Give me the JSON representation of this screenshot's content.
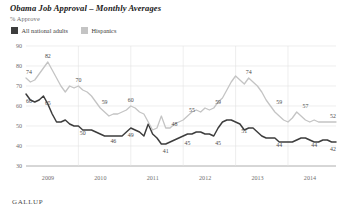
{
  "header": {
    "title": "Obama Job Approval – Monthly Averages",
    "subtitle": "% Approve",
    "source": "GALLUP"
  },
  "legend": {
    "items": [
      {
        "label": "All national adults",
        "color": "#3d3d3d"
      },
      {
        "label": "Hispanics",
        "color": "#c4c4c4"
      }
    ]
  },
  "chart_data": {
    "type": "line",
    "title": "Obama Job Approval – Monthly Averages",
    "subtitle": "% Approve",
    "xlabel": "",
    "ylabel": "% Approve",
    "ylim": [
      30,
      90
    ],
    "yticks": [
      30,
      40,
      50,
      60,
      70,
      80,
      90
    ],
    "xticks": [
      "2009",
      "2010",
      "2011",
      "2012",
      "2013",
      "2014"
    ],
    "xlim": [
      "2009-01",
      "2014-12"
    ],
    "grid": "horizontal-and-vertical",
    "legend_position": "top-left",
    "x": [
      "2009-01",
      "2009-02",
      "2009-03",
      "2009-04",
      "2009-05",
      "2009-06",
      "2009-07",
      "2009-08",
      "2009-09",
      "2009-10",
      "2009-11",
      "2009-12",
      "2010-01",
      "2010-02",
      "2010-03",
      "2010-04",
      "2010-05",
      "2010-06",
      "2010-07",
      "2010-08",
      "2010-09",
      "2010-10",
      "2010-11",
      "2010-12",
      "2011-01",
      "2011-02",
      "2011-03",
      "2011-04",
      "2011-05",
      "2011-06",
      "2011-07",
      "2011-08",
      "2011-09",
      "2011-10",
      "2011-11",
      "2011-12",
      "2012-01",
      "2012-02",
      "2012-03",
      "2012-04",
      "2012-05",
      "2012-06",
      "2012-07",
      "2012-08",
      "2012-09",
      "2012-10",
      "2012-11",
      "2012-12",
      "2013-01",
      "2013-02",
      "2013-03",
      "2013-04",
      "2013-05",
      "2013-06",
      "2013-07",
      "2013-08",
      "2013-09",
      "2013-10",
      "2013-11",
      "2013-12",
      "2014-01",
      "2014-02",
      "2014-03",
      "2014-04",
      "2014-05",
      "2014-06",
      "2014-07",
      "2014-08",
      "2014-09",
      "2014-10",
      "2014-11",
      "2014-12"
    ],
    "series": [
      {
        "name": "All national adults",
        "color": "#3d3d3d",
        "values": [
          66,
          63,
          62,
          63,
          65,
          61,
          56,
          52,
          52,
          53,
          51,
          50,
          50,
          48,
          48,
          48,
          47,
          46,
          45,
          45,
          45,
          45,
          45,
          47,
          49,
          48,
          47,
          45,
          51,
          46,
          44,
          41,
          41,
          42,
          43,
          44,
          45,
          46,
          46,
          47,
          47,
          46,
          46,
          45,
          49,
          52,
          53,
          53,
          52,
          51,
          48,
          49,
          49,
          47,
          45,
          44,
          44,
          44,
          42,
          42,
          42,
          42,
          43,
          44,
          44,
          43,
          42,
          42,
          43,
          43,
          42,
          42
        ]
      },
      {
        "name": "Hispanics",
        "color": "#c4c4c4",
        "values": [
          74,
          72,
          73,
          76,
          79,
          82,
          78,
          74,
          70,
          67,
          70,
          69,
          70,
          68,
          67,
          65,
          62,
          59,
          57,
          55,
          56,
          56,
          57,
          58,
          60,
          59,
          57,
          56,
          52,
          48,
          49,
          55,
          49,
          49,
          51,
          52,
          53,
          55,
          57,
          58,
          57,
          59,
          58,
          59,
          62,
          64,
          68,
          72,
          75,
          73,
          71,
          74,
          72,
          70,
          67,
          63,
          60,
          57,
          55,
          53,
          52,
          54,
          57,
          55,
          53,
          52,
          53,
          52,
          52,
          52,
          52,
          52
        ]
      }
    ],
    "point_labels": [
      {
        "series": "All national adults",
        "x": "2009-01",
        "value": 66,
        "text": "66"
      },
      {
        "series": "All national adults",
        "x": "2009-06",
        "value": 65,
        "text": "65"
      },
      {
        "series": "All national adults",
        "x": "2010-02",
        "value": 50,
        "text": "50"
      },
      {
        "series": "All national adults",
        "x": "2010-09",
        "value": 46,
        "text": "46"
      },
      {
        "series": "All national adults",
        "x": "2011-01",
        "value": 49,
        "text": "49"
      },
      {
        "series": "All national adults",
        "x": "2011-09",
        "value": 41,
        "text": "41"
      },
      {
        "series": "All national adults",
        "x": "2012-02",
        "value": 45,
        "text": "45"
      },
      {
        "series": "All national adults",
        "x": "2012-09",
        "value": 45,
        "text": "45"
      },
      {
        "series": "All national adults",
        "x": "2013-03",
        "value": 51,
        "text": "51"
      },
      {
        "series": "All national adults",
        "x": "2013-11",
        "value": 44,
        "text": "44"
      },
      {
        "series": "All national adults",
        "x": "2014-07",
        "value": 44,
        "text": "44"
      },
      {
        "series": "All national adults",
        "x": "2014-12",
        "value": 42,
        "text": "42"
      },
      {
        "series": "Hispanics",
        "x": "2009-01",
        "value": 74,
        "text": "74"
      },
      {
        "series": "Hispanics",
        "x": "2009-06",
        "value": 82,
        "text": "82"
      },
      {
        "series": "Hispanics",
        "x": "2010-01",
        "value": 70,
        "text": "70"
      },
      {
        "series": "Hispanics",
        "x": "2010-07",
        "value": 59,
        "text": "59"
      },
      {
        "series": "Hispanics",
        "x": "2011-01",
        "value": 60,
        "text": "60"
      },
      {
        "series": "Hispanics",
        "x": "2011-11",
        "value": 48,
        "text": "48"
      },
      {
        "series": "Hispanics",
        "x": "2012-03",
        "value": 55,
        "text": "55"
      },
      {
        "series": "Hispanics",
        "x": "2012-09",
        "value": 59,
        "text": "59"
      },
      {
        "series": "Hispanics",
        "x": "2013-04",
        "value": 74,
        "text": "74"
      },
      {
        "series": "Hispanics",
        "x": "2013-11",
        "value": 59,
        "text": "59"
      },
      {
        "series": "Hispanics",
        "x": "2014-05",
        "value": 57,
        "text": "57"
      },
      {
        "series": "Hispanics",
        "x": "2014-12",
        "value": 52,
        "text": "52"
      }
    ]
  }
}
